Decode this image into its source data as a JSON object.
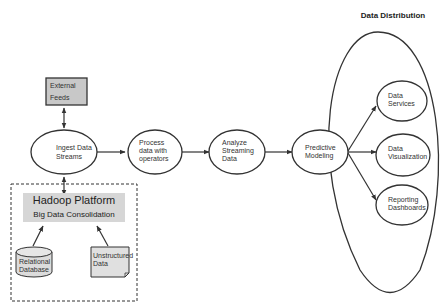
{
  "diagram": {
    "title": "Data Distribution",
    "nodes": {
      "external_feeds": {
        "lines": [
          "External",
          "Feeds"
        ],
        "shape": "rectangle",
        "fill": "#c8c8c8"
      },
      "ingest": {
        "lines": [
          "Ingest Data",
          "Streams"
        ],
        "shape": "ellipse"
      },
      "process": {
        "lines": [
          "Process",
          "data with",
          "operators"
        ],
        "shape": "ellipse"
      },
      "analyze": {
        "lines": [
          "Analyze",
          "Streaming",
          "Data"
        ],
        "shape": "ellipse"
      },
      "predictive": {
        "lines": [
          "Predictive",
          "Modeling"
        ],
        "shape": "ellipse"
      },
      "data_services": {
        "lines": [
          "Data",
          "Services"
        ],
        "shape": "ellipse"
      },
      "data_visualization": {
        "lines": [
          "Data",
          "Visualization"
        ],
        "shape": "ellipse"
      },
      "reporting": {
        "lines": [
          "Reporting",
          "Dashboards"
        ],
        "shape": "ellipse"
      },
      "hadoop": {
        "title": "Hadoop Platform",
        "subtitle": "Big Data Consolidation",
        "fill": "#d6d6d6"
      },
      "relational_db": {
        "lines": [
          "Relational",
          "Database"
        ],
        "shape": "cylinder"
      },
      "unstructured": {
        "lines": [
          "Unstructured",
          "Data"
        ],
        "shape": "document"
      }
    },
    "edges": [
      {
        "from": "external_feeds",
        "to": "ingest",
        "bidirectional": true
      },
      {
        "from": "hadoop",
        "to": "ingest",
        "bidirectional": true
      },
      {
        "from": "ingest",
        "to": "process"
      },
      {
        "from": "process",
        "to": "analyze"
      },
      {
        "from": "analyze",
        "to": "predictive"
      },
      {
        "from": "predictive",
        "to": "data_services"
      },
      {
        "from": "predictive",
        "to": "data_visualization"
      },
      {
        "from": "predictive",
        "to": "reporting"
      },
      {
        "from": "relational_db",
        "to": "hadoop"
      },
      {
        "from": "unstructured",
        "to": "hadoop"
      }
    ]
  }
}
